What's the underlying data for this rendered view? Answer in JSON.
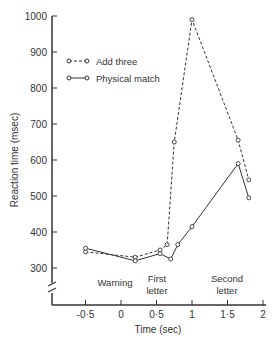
{
  "chart_data": {
    "type": "line",
    "title": "",
    "xlabel": "Time (sec)",
    "ylabel": "Reaction time (msec)",
    "xlim": [
      -1,
      2
    ],
    "ylim": [
      250,
      1000
    ],
    "xticks": [
      "-0.5",
      "0",
      "0.5",
      "1",
      "1.5",
      "2"
    ],
    "yticks": [
      "300",
      "400",
      "500",
      "600",
      "700",
      "800",
      "900",
      "1000"
    ],
    "annotations": [
      "Warning",
      "First letter",
      "Second letter"
    ],
    "legend": {
      "position": "upper-left"
    },
    "series": [
      {
        "name": "Add three",
        "style": "dashed",
        "x": [
          -0.5,
          0.2,
          0.55,
          0.65,
          0.75,
          1.0,
          1.65,
          1.8
        ],
        "y": [
          345,
          330,
          350,
          365,
          650,
          990,
          655,
          545
        ]
      },
      {
        "name": "Physical match",
        "style": "solid",
        "x": [
          -0.5,
          0.2,
          0.55,
          0.7,
          0.8,
          1.0,
          1.65,
          1.8
        ],
        "y": [
          355,
          320,
          340,
          325,
          365,
          415,
          590,
          495
        ]
      }
    ]
  },
  "labels": {
    "xlabel": "Time (sec)",
    "ylabel": "Reaction time (msec)",
    "legend1": "Add three",
    "legend2": "Physical match",
    "warning": "Warning",
    "first1": "First",
    "first2": "letter",
    "second1": "Second",
    "second2": "letter"
  }
}
